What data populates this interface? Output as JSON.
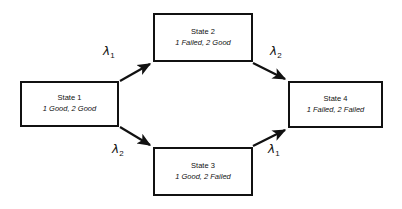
{
  "diagram": {
    "type": "state-transition-diagram",
    "title": "",
    "background_color": "#ffffff",
    "line_color": "#111111",
    "states": [
      {
        "id": "state-1",
        "title": "State 1",
        "description": "1 Good, 2 Good",
        "x": 20,
        "y": 81,
        "width": 99,
        "height": 46
      },
      {
        "id": "state-2",
        "title": "State 2",
        "description": "1 Failed, 2 Good",
        "x": 153,
        "y": 13,
        "width": 100,
        "height": 49
      },
      {
        "id": "state-3",
        "title": "State 3",
        "description": "1 Good, 2 Failed",
        "x": 153,
        "y": 147,
        "width": 100,
        "height": 49
      },
      {
        "id": "state-4",
        "title": "State 4",
        "description": "1 Failed, 2 Failed",
        "x": 288,
        "y": 81,
        "width": 95,
        "height": 47
      }
    ],
    "transitions": [
      {
        "id": "transition-1-to-2",
        "from": "state-1",
        "to": "state-2",
        "label": "λ",
        "subscript": "1",
        "label_x": 103,
        "label_y": 45
      },
      {
        "id": "transition-2-to-4",
        "from": "state-2",
        "to": "state-4",
        "label": "λ",
        "subscript": "2",
        "label_x": 270,
        "label_y": 45
      },
      {
        "id": "transition-1-to-3",
        "from": "state-1",
        "to": "state-3",
        "label": "λ",
        "subscript": "2",
        "label_x": 112,
        "label_y": 143
      },
      {
        "id": "transition-3-to-4",
        "from": "state-3",
        "to": "state-4",
        "label": "λ",
        "subscript": "1",
        "label_x": 268,
        "label_y": 143
      }
    ]
  }
}
